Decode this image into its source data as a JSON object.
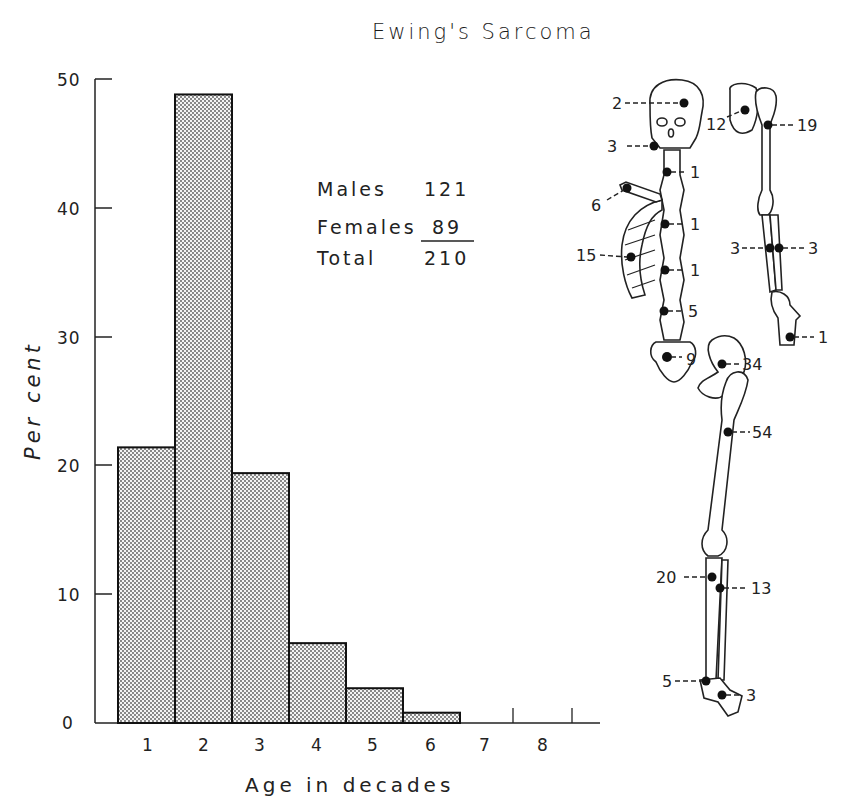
{
  "chart_data": {
    "type": "bar",
    "title": "Ewing's Sarcoma",
    "xlabel": "Age in decades",
    "ylabel": "Per cent",
    "categories": [
      "1",
      "2",
      "3",
      "4",
      "5",
      "6",
      "7",
      "8"
    ],
    "values": [
      21.4,
      48.8,
      19.4,
      6.2,
      2.7,
      0.8,
      0,
      0
    ],
    "ylim": [
      0,
      50
    ],
    "yticks": [
      "0",
      "10",
      "20",
      "30",
      "40",
      "50"
    ],
    "grid": false,
    "bar_fill": "stippled",
    "annotations": {
      "legend_table": [
        {
          "label": "Males",
          "value": "121"
        },
        {
          "label": "Females",
          "value": "89"
        },
        {
          "label": "Total",
          "value": "210"
        }
      ]
    },
    "skeleton_site_counts": [
      {
        "site": "skull",
        "label": "2"
      },
      {
        "site": "mandible",
        "label": "3"
      },
      {
        "site": "cervical-spine",
        "label": "1"
      },
      {
        "site": "clavicle",
        "label": "6"
      },
      {
        "site": "thoracic-spine-upper",
        "label": "1"
      },
      {
        "site": "ribs",
        "label": "15"
      },
      {
        "site": "thoracic-spine-lower",
        "label": "1"
      },
      {
        "site": "lumbar-spine",
        "label": "5"
      },
      {
        "site": "sacrum",
        "label": "9"
      },
      {
        "site": "scapula",
        "label": "12"
      },
      {
        "site": "humerus",
        "label": "19"
      },
      {
        "site": "ulna",
        "label": "3"
      },
      {
        "site": "radius",
        "label": "3"
      },
      {
        "site": "hand",
        "label": "1"
      },
      {
        "site": "pelvis",
        "label": "34"
      },
      {
        "site": "femur",
        "label": "54"
      },
      {
        "site": "tibia",
        "label": "20"
      },
      {
        "site": "fibula",
        "label": "13"
      },
      {
        "site": "calcaneus",
        "label": "5"
      },
      {
        "site": "foot",
        "label": "3"
      }
    ]
  },
  "legend": {
    "males_label": "Males",
    "males_value": "121",
    "females_label": "Females",
    "females_value": "89",
    "total_label": "Total",
    "total_value": "210"
  },
  "axis": {
    "y_ticks": [
      "0",
      "10",
      "20",
      "30",
      "40",
      "50"
    ],
    "x_ticks": [
      "1",
      "2",
      "3",
      "4",
      "5",
      "6",
      "7",
      "8"
    ],
    "xlabel": "Age in decades",
    "ylabel": "Per cent"
  },
  "title": "Ewing's Sarcoma",
  "sites": {
    "skull": "2",
    "mandible": "3",
    "cervical": "1",
    "clavicle": "6",
    "thoracic_upper": "1",
    "ribs": "15",
    "thoracic_lower": "1",
    "lumbar": "5",
    "sacrum": "9",
    "scapula": "12",
    "humerus": "19",
    "ulna": "3",
    "radius": "3",
    "hand": "1",
    "pelvis": "34",
    "femur": "54",
    "tibia": "20",
    "fibula": "13",
    "calcaneus": "5",
    "foot": "3"
  }
}
